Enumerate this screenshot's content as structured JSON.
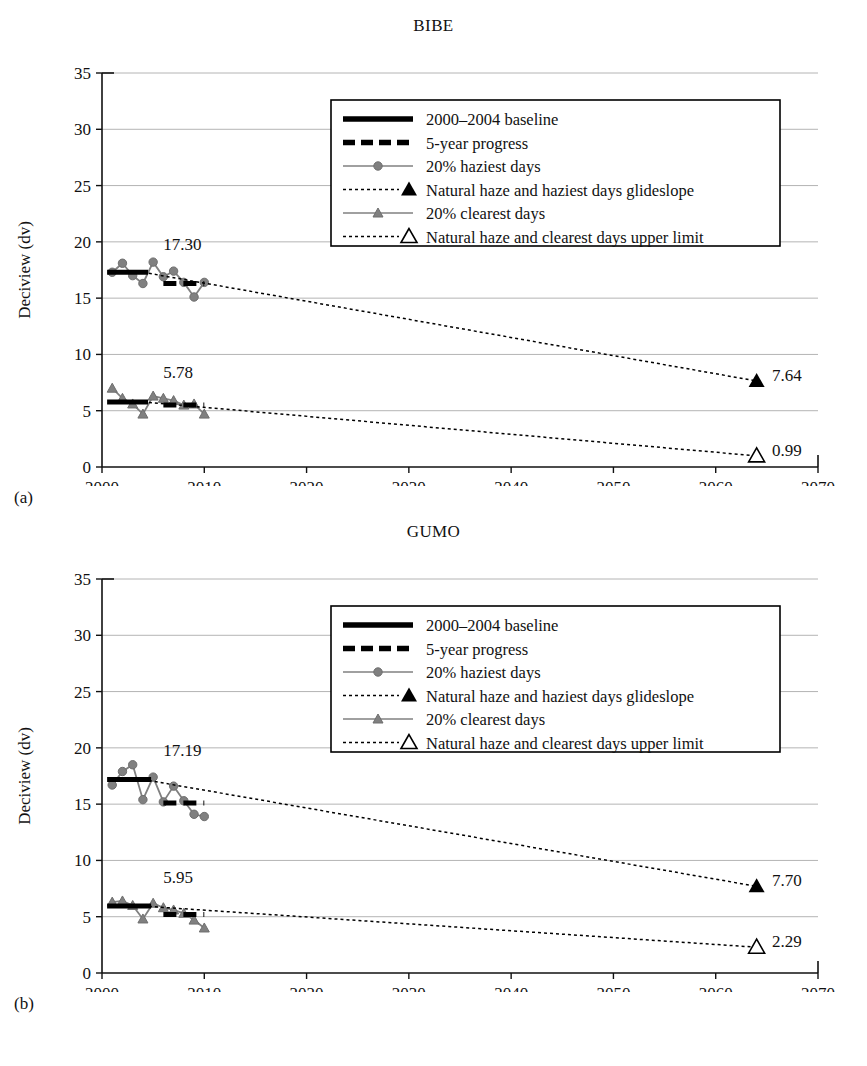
{
  "figure": {
    "panels": [
      {
        "tag": "(a)",
        "title": "BIBE",
        "xlabel": "Year",
        "ylabel": "Deciview (dv)",
        "baseline_label": "17.30",
        "clearest_label": "5.78",
        "glideslope_end_label": "7.64",
        "clearest_limit_end_label": "2.29_unused"
      },
      {
        "tag": "(b)",
        "title": "GUMO",
        "xlabel": "Year",
        "ylabel": "Deciview (dv)",
        "baseline_label": "17.19",
        "clearest_label": "5.95",
        "glideslope_end_label": "7.70",
        "clearest_limit_end_label": "2.29"
      }
    ],
    "legend": {
      "items": [
        {
          "label": "2000–2004 baseline",
          "marker": "thick-solid-line",
          "color": "#000000"
        },
        {
          "label": "5-year progress",
          "marker": "thick-dashed-line",
          "color": "#000000"
        },
        {
          "label": "20% haziest days",
          "marker": "line-with-circle",
          "color": "#808080"
        },
        {
          "label": "Natural haze and haziest days glideslope",
          "marker": "dotted-line-filled-triangle",
          "color": "#000000"
        },
        {
          "label": "20% clearest days",
          "marker": "line-with-triangle",
          "color": "#808080"
        },
        {
          "label": "Natural haze and clearest days upper limit",
          "marker": "dotted-line-open-triangle",
          "color": "#000000"
        }
      ]
    },
    "colors": {
      "axis": "#111111",
      "grid": "#b4b4b4",
      "series_gray": "#808080",
      "baseline_black": "#000000",
      "background": "#ffffff"
    }
  },
  "chart_data": [
    {
      "type": "line",
      "title": "BIBE",
      "tag": "(a)",
      "xlabel": "Year",
      "ylabel": "Deciview (dv)",
      "xlim": [
        2000,
        2070
      ],
      "ylim": [
        0,
        35
      ],
      "xticks": [
        2000,
        2010,
        2020,
        2030,
        2040,
        2050,
        2060,
        2070
      ],
      "yticks": [
        0,
        5,
        10,
        15,
        20,
        25,
        30,
        35
      ],
      "grid": true,
      "legend_position": "top-right-inside",
      "annotations": [
        {
          "text": "17.30",
          "x": 2006.0,
          "y": 19.3
        },
        {
          "text": "5.78",
          "x": 2006.0,
          "y": 7.9
        },
        {
          "text": "7.64",
          "x": 2065.5,
          "y": 7.64
        },
        {
          "text": "0.99",
          "x": 2065.5,
          "y": 0.99
        }
      ],
      "series": [
        {
          "name": "20% haziest days",
          "style": "line-circle-gray",
          "x": [
            2001,
            2002,
            2003,
            2004,
            2005,
            2006,
            2007,
            2008,
            2009,
            2010
          ],
          "values": [
            17.3,
            18.1,
            17.0,
            16.3,
            18.2,
            16.9,
            17.4,
            16.4,
            15.1,
            16.4
          ]
        },
        {
          "name": "20% clearest days",
          "style": "line-triangle-gray",
          "x": [
            2001,
            2002,
            2003,
            2004,
            2005,
            2006,
            2007,
            2008,
            2009,
            2010
          ],
          "values": [
            7.0,
            6.1,
            5.6,
            4.7,
            6.3,
            6.1,
            5.9,
            5.5,
            5.6,
            4.7
          ]
        },
        {
          "name": "2000–2004 baseline",
          "style": "thick-solid-black",
          "x": [
            2000.5,
            2004.5
          ],
          "values": [
            17.3,
            17.3
          ]
        },
        {
          "name": "2000–2004 baseline (clearest)",
          "style": "thick-solid-black",
          "x": [
            2000.5,
            2004.5
          ],
          "values": [
            5.78,
            5.78
          ]
        },
        {
          "name": "5-year progress",
          "style": "thick-dashed-black",
          "x": [
            2006.0,
            2010.0
          ],
          "values": [
            16.3,
            16.3
          ]
        },
        {
          "name": "5-year progress (clearest)",
          "style": "thick-dashed-black",
          "x": [
            2006.0,
            2010.0
          ],
          "values": [
            5.5,
            5.5
          ]
        },
        {
          "name": "Natural haze and haziest days glideslope",
          "style": "dotted-black",
          "x": [
            2004,
            2064
          ],
          "values": [
            17.3,
            7.64
          ]
        },
        {
          "name": "Natural haze and clearest days upper limit",
          "style": "dotted-black",
          "x": [
            2004,
            2064
          ],
          "values": [
            5.78,
            0.99
          ]
        }
      ],
      "endpoints": [
        {
          "name": "glideslope-end",
          "marker": "filled-triangle",
          "x": 2064,
          "y": 7.64,
          "label": "7.64"
        },
        {
          "name": "clearest-limit-end",
          "marker": "open-triangle",
          "x": 2064,
          "y": 0.99,
          "label": "0.99"
        }
      ]
    },
    {
      "type": "line",
      "title": "GUMO",
      "tag": "(b)",
      "xlabel": "Year",
      "ylabel": "Deciview (dv)",
      "xlim": [
        2000,
        2070
      ],
      "ylim": [
        0,
        35
      ],
      "xticks": [
        2000,
        2010,
        2020,
        2030,
        2040,
        2050,
        2060,
        2070
      ],
      "yticks": [
        0,
        5,
        10,
        15,
        20,
        25,
        30,
        35
      ],
      "grid": true,
      "legend_position": "top-right-inside",
      "annotations": [
        {
          "text": "17.19",
          "x": 2006.0,
          "y": 19.3
        },
        {
          "text": "5.95",
          "x": 2006.0,
          "y": 8.0
        },
        {
          "text": "7.70",
          "x": 2065.5,
          "y": 7.7
        },
        {
          "text": "2.29",
          "x": 2065.5,
          "y": 2.29
        }
      ],
      "series": [
        {
          "name": "20% haziest days",
          "style": "line-circle-gray",
          "x": [
            2001,
            2002,
            2003,
            2004,
            2005,
            2006,
            2007,
            2008,
            2009,
            2010
          ],
          "values": [
            16.7,
            17.9,
            18.5,
            15.4,
            17.4,
            15.2,
            16.6,
            15.3,
            14.1,
            13.9
          ]
        },
        {
          "name": "20% clearest days",
          "style": "line-triangle-gray",
          "x": [
            2001,
            2002,
            2003,
            2004,
            2005,
            2006,
            2007,
            2008,
            2009,
            2010
          ],
          "values": [
            6.3,
            6.4,
            6.0,
            4.8,
            6.2,
            5.8,
            5.6,
            5.3,
            4.7,
            4.0
          ]
        },
        {
          "name": "2000–2004 baseline",
          "style": "thick-solid-black",
          "x": [
            2000.5,
            2004.8
          ],
          "values": [
            17.19,
            17.19
          ]
        },
        {
          "name": "2000–2004 baseline (clearest)",
          "style": "thick-solid-black",
          "x": [
            2000.5,
            2004.8
          ],
          "values": [
            5.95,
            5.95
          ]
        },
        {
          "name": "5-year progress",
          "style": "thick-dashed-black",
          "x": [
            2006.0,
            2010.0
          ],
          "values": [
            15.1,
            15.1
          ]
        },
        {
          "name": "5-year progress (clearest)",
          "style": "thick-dashed-black",
          "x": [
            2006.0,
            2010.0
          ],
          "values": [
            5.2,
            5.2
          ]
        },
        {
          "name": "Natural haze and haziest days glideslope",
          "style": "dotted-black",
          "x": [
            2004,
            2064
          ],
          "values": [
            17.19,
            7.7
          ]
        },
        {
          "name": "Natural haze and clearest days upper limit",
          "style": "dotted-black",
          "x": [
            2004,
            2064
          ],
          "values": [
            5.95,
            2.29
          ]
        }
      ],
      "endpoints": [
        {
          "name": "glideslope-end",
          "marker": "filled-triangle",
          "x": 2064,
          "y": 7.7,
          "label": "7.70"
        },
        {
          "name": "clearest-limit-end",
          "marker": "open-triangle",
          "x": 2064,
          "y": 2.29,
          "label": "2.29"
        }
      ]
    }
  ]
}
